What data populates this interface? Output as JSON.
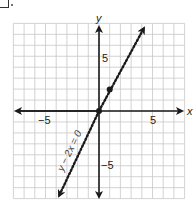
{
  "chart_data": {
    "type": "line",
    "title": "",
    "xlabel": "x",
    "ylabel": "y",
    "xlim": [
      -8,
      8
    ],
    "ylim": [
      -8,
      8
    ],
    "grid": true,
    "x_ticks_labeled": [
      "-5",
      "5"
    ],
    "y_ticks_labeled": [
      "5",
      "-5"
    ],
    "series": [
      {
        "name": "y − 2x = 0",
        "style": "dotted",
        "equation": "y = 2x",
        "x": [
          -4,
          4
        ],
        "y": [
          -8,
          8
        ],
        "arrows": "both"
      }
    ],
    "points": [
      {
        "x": 0,
        "y": 0
      },
      {
        "x": 1,
        "y": 2
      }
    ],
    "annotations": [
      {
        "text": "y − 2x = 0",
        "rotated_along_line": true
      }
    ]
  },
  "labels": {
    "x_axis": "x",
    "y_axis": "y",
    "x_neg": "−5",
    "x_pos": "5",
    "y_pos": "5",
    "y_neg": "−5",
    "equation": "y − 2x = 0"
  },
  "colors": {
    "grid": "#c8c8c8",
    "axis": "#1a1a1a",
    "line": "#1a1a1a"
  }
}
